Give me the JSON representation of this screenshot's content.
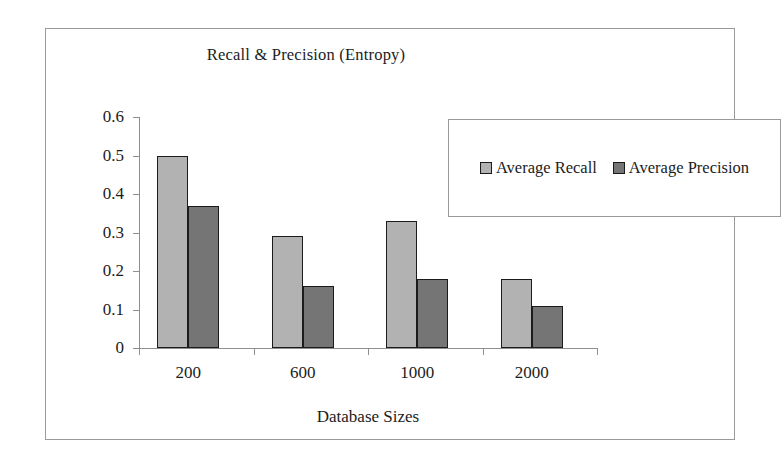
{
  "chart_data": {
    "type": "bar",
    "title": "Recall & Precision (Entropy)",
    "xlabel": "Database Sizes",
    "ylabel": "",
    "categories": [
      "200",
      "600",
      "1000",
      "2000"
    ],
    "series": [
      {
        "name": "Average Recall",
        "color": "#b2b2b2",
        "values": [
          0.5,
          0.29,
          0.33,
          0.18
        ]
      },
      {
        "name": "Average Precision",
        "color": "#757575",
        "values": [
          0.37,
          0.16,
          0.18,
          0.11
        ]
      }
    ],
    "ylim": [
      0,
      0.6
    ],
    "yticks": [
      "0",
      "0.1",
      "0.2",
      "0.3",
      "0.4",
      "0.5",
      "0.6"
    ],
    "ytick_values": [
      0,
      0.1,
      0.2,
      0.3,
      0.4,
      0.5,
      0.6
    ],
    "grid": false,
    "legend_position": "upper-right-inset",
    "frame": true
  },
  "legend": {
    "entries": [
      {
        "label": "Average Recall"
      },
      {
        "label": "Average Precision"
      }
    ]
  }
}
